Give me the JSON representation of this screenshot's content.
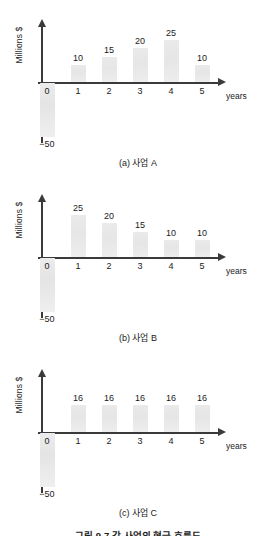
{
  "page": {
    "figure_caption": "그림 9-7 각 사업의 현금 흐름도"
  },
  "common": {
    "y_axis_title": "Millions $",
    "x_axis_title": "years",
    "x_ticks": [
      "0",
      "1",
      "2",
      "3",
      "4",
      "5"
    ],
    "initial_investment_label": "−50",
    "bar_color": "#e8e8e8",
    "axis_color": "#3a3a3a"
  },
  "chart_data": [
    {
      "id": "a",
      "type": "bar",
      "title": "(a) 사업 A",
      "xlabel": "years",
      "ylabel": "Millions $",
      "categories": [
        "0",
        "1",
        "2",
        "3",
        "4",
        "5"
      ],
      "values": [
        -50,
        10,
        15,
        20,
        25,
        10
      ],
      "value_labels": [
        "−50",
        "10",
        "15",
        "20",
        "25",
        "10"
      ],
      "ylim": [
        -50,
        25
      ],
      "grid": false,
      "legend": null
    },
    {
      "id": "b",
      "type": "bar",
      "title": "(b) 사업 B",
      "xlabel": "years",
      "ylabel": "Millions $",
      "categories": [
        "0",
        "1",
        "2",
        "3",
        "4",
        "5"
      ],
      "values": [
        -50,
        25,
        20,
        15,
        10,
        10
      ],
      "value_labels": [
        "−50",
        "25",
        "20",
        "15",
        "10",
        "10"
      ],
      "ylim": [
        -50,
        25
      ],
      "grid": false,
      "legend": null
    },
    {
      "id": "c",
      "type": "bar",
      "title": "(c) 사업 C",
      "xlabel": "years",
      "ylabel": "Millions $",
      "categories": [
        "0",
        "1",
        "2",
        "3",
        "4",
        "5"
      ],
      "values": [
        -50,
        16,
        16,
        16,
        16,
        16
      ],
      "value_labels": [
        "−50",
        "16",
        "16",
        "16",
        "16",
        "16"
      ],
      "ylim": [
        -50,
        25
      ],
      "grid": false,
      "legend": null
    }
  ]
}
